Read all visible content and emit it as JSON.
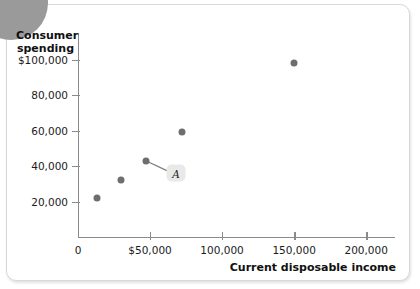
{
  "figure": {
    "decoration": "corner-circle",
    "accent_color": "#6e6e6e",
    "axis_color": "#8a8a8a",
    "badge_color": "#e9e9e9"
  },
  "chart_data": {
    "type": "scatter",
    "title": "",
    "xlabel": "Current disposable income",
    "ylabel": "Consumer spending",
    "xlim": [
      0,
      220000
    ],
    "ylim": [
      0,
      115000
    ],
    "grid": false,
    "legend": null,
    "xticks": [
      {
        "value": 0,
        "label": "0"
      },
      {
        "value": 50000,
        "label": "$50,000"
      },
      {
        "value": 100000,
        "label": "100,000"
      },
      {
        "value": 150000,
        "label": "150,000"
      },
      {
        "value": 200000,
        "label": "200,000"
      }
    ],
    "yticks": [
      {
        "value": 20000,
        "label": "20,000"
      },
      {
        "value": 40000,
        "label": "40,000"
      },
      {
        "value": 60000,
        "label": "60,000"
      },
      {
        "value": 80000,
        "label": "80,000"
      },
      {
        "value": 100000,
        "label": "$100,000"
      }
    ],
    "points": [
      {
        "x": 13000,
        "y": 22000
      },
      {
        "x": 30000,
        "y": 32000
      },
      {
        "x": 47000,
        "y": 43000
      },
      {
        "x": 72000,
        "y": 59000
      },
      {
        "x": 150000,
        "y": 98000
      }
    ],
    "annotations": [
      {
        "label": "A",
        "target_x": 47000,
        "target_y": 43000,
        "badge_x": 68000,
        "badge_y": 36000
      }
    ]
  }
}
